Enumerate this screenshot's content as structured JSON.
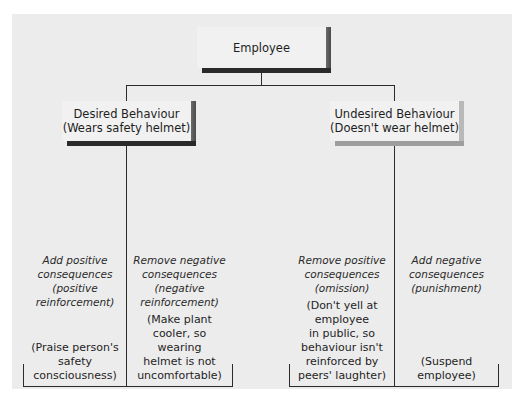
{
  "diagram": {
    "title": "Employee",
    "branches": [
      {
        "id": "desired",
        "label_line1": "Desired Behaviour",
        "label_line2": "(Wears safety helmet)",
        "shadow_color": "#2a2a2a",
        "options": [
          {
            "kind_line1": "Add positive",
            "kind_line2": "consequences",
            "kind_line3": "(positive",
            "kind_line4": "reinforcement)",
            "example_lines": [
              "(Praise person's",
              "safety",
              "consciousness)"
            ]
          },
          {
            "kind_line1": "Remove negative",
            "kind_line2": "consequences",
            "kind_line3": "(negative",
            "kind_line4": "reinforcement)",
            "example_lines": [
              "(Make plant",
              "cooler, so",
              "wearing",
              "helmet is not",
              "uncomfortable)"
            ]
          }
        ]
      },
      {
        "id": "undesired",
        "label_line1": "Undesired Behaviour",
        "label_line2": "(Doesn't wear helmet)",
        "shadow_color": "#9e9e9e",
        "options": [
          {
            "kind_line1": "Remove positive",
            "kind_line2": "consequences",
            "kind_line3": "(omission)",
            "kind_line4": "",
            "example_lines": [
              "(Don't yell at",
              "employee",
              "in public, so",
              "behaviour isn't",
              "reinforced by",
              "peers' laughter)"
            ]
          },
          {
            "kind_line1": "Add negative",
            "kind_line2": "consequences",
            "kind_line3": "(punishment)",
            "kind_line4": "",
            "example_lines": [
              "(Suspend",
              "employee)"
            ]
          }
        ]
      }
    ]
  },
  "colors": {
    "panel_background": "#ececec",
    "box_face": "#f1f1f1",
    "line": "#2b2b2b"
  }
}
